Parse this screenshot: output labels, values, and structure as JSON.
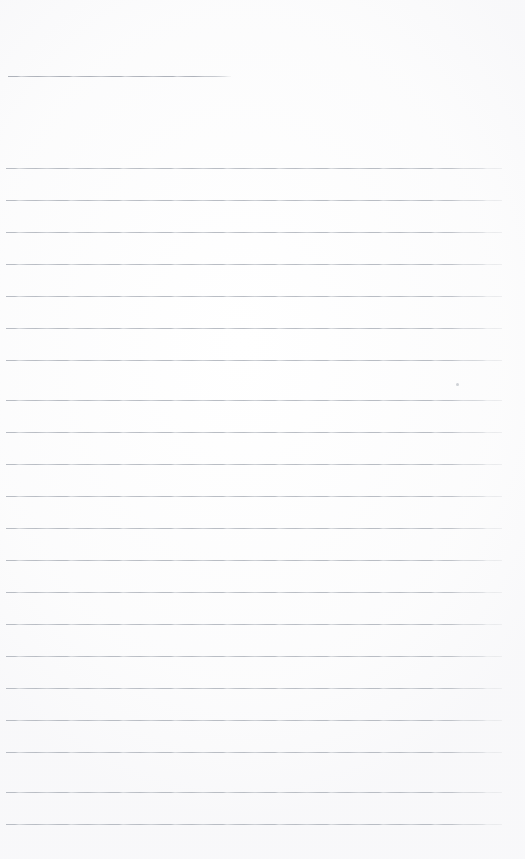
{
  "document": {
    "type": "scanned-ruled-notepaper",
    "title_text": "",
    "body_text": "",
    "width": 525,
    "height": 859,
    "background_color": "#ffffff",
    "rule_color": "#b9bdc4",
    "header_rule_color": "#aeb2ba",
    "is_blank": true
  },
  "header_rule": {
    "name": "title-rule",
    "label": "",
    "x": 8,
    "y": 76,
    "width": 223
  },
  "body_rules": [
    {
      "index": 1,
      "y": 168
    },
    {
      "index": 2,
      "y": 200
    },
    {
      "index": 3,
      "y": 232
    },
    {
      "index": 4,
      "y": 264
    },
    {
      "index": 5,
      "y": 296
    },
    {
      "index": 6,
      "y": 328
    },
    {
      "index": 7,
      "y": 360
    },
    {
      "index": 8,
      "y": 400
    },
    {
      "index": 9,
      "y": 432
    },
    {
      "index": 10,
      "y": 464
    },
    {
      "index": 11,
      "y": 496
    },
    {
      "index": 12,
      "y": 528
    },
    {
      "index": 13,
      "y": 560
    },
    {
      "index": 14,
      "y": 592
    },
    {
      "index": 15,
      "y": 624
    },
    {
      "index": 16,
      "y": 656
    },
    {
      "index": 17,
      "y": 688
    },
    {
      "index": 18,
      "y": 720
    },
    {
      "index": 19,
      "y": 752
    },
    {
      "index": 20,
      "y": 792
    },
    {
      "index": 21,
      "y": 824
    }
  ],
  "artifacts": [
    {
      "name": "scan-speck",
      "x": 456,
      "y": 383
    }
  ]
}
